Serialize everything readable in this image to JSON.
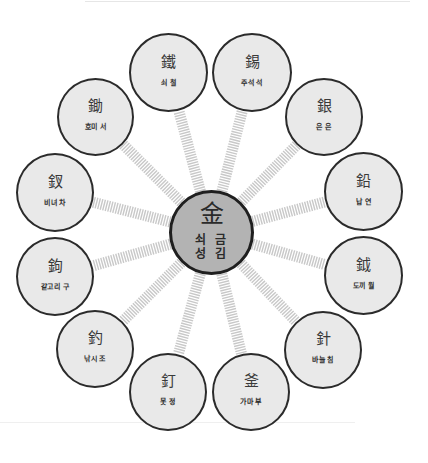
{
  "diagram": {
    "type": "radial",
    "colors": {
      "center_fill": "#b3b3b3",
      "node_fill": "#e9e9e9",
      "node_border": "#2b2b2b",
      "spoke": "#c8c8c8"
    },
    "center": {
      "hanja": "金",
      "meaning": "쇠 금",
      "surname": "성 김"
    },
    "nodes": [
      {
        "hanja": "鐵",
        "reading": "쇠 철"
      },
      {
        "hanja": "錫",
        "reading": "주석 석"
      },
      {
        "hanja": "銀",
        "reading": "은 은"
      },
      {
        "hanja": "鉛",
        "reading": "납 연"
      },
      {
        "hanja": "鉞",
        "reading": "도끼 월"
      },
      {
        "hanja": "針",
        "reading": "바늘 침"
      },
      {
        "hanja": "釜",
        "reading": "가마 부"
      },
      {
        "hanja": "釘",
        "reading": "못 정"
      },
      {
        "hanja": "釣",
        "reading": "낚시 조"
      },
      {
        "hanja": "鉤",
        "reading": "갈고리 구"
      },
      {
        "hanja": "釵",
        "reading": "비녀 차"
      },
      {
        "hanja": "鋤",
        "reading": "호미 서"
      }
    ]
  }
}
